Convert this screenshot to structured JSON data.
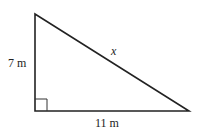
{
  "diagram": {
    "type": "right-triangle",
    "vertices": {
      "top": [
        35,
        14
      ],
      "right_angle": [
        35,
        111
      ],
      "right": [
        189,
        111
      ]
    },
    "labels": {
      "vertical_side": "7 m",
      "horizontal_side": "11 m",
      "hypotenuse": "x"
    },
    "right_angle_marker_size": 12,
    "colors": {
      "stroke": "#222222",
      "background": "#ffffff"
    }
  }
}
